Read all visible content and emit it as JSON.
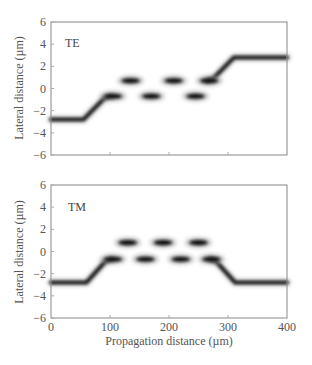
{
  "chart_data": [
    {
      "type": "heatmap",
      "title": "",
      "panel_label": "TE",
      "xlabel": "",
      "ylabel": "Lateral distance (µm)",
      "xlim": [
        0,
        400
      ],
      "ylim": [
        -6,
        6
      ],
      "xticks": [
        0,
        100,
        200,
        300,
        400
      ],
      "xtick_labels_shown": false,
      "yticks": [
        6,
        4,
        2,
        0,
        -2,
        -4,
        -6
      ],
      "ytick_labels": [
        "6",
        "4",
        "2",
        "0",
        "−2",
        "−4",
        "−6"
      ],
      "beam_path": [
        {
          "x": 0,
          "y": -2.8
        },
        {
          "x": 55,
          "y": -2.8
        },
        {
          "x": 90,
          "y": -0.9
        },
        {
          "x": 100,
          "y": -0.7
        }
      ],
      "beam_path_end": [
        {
          "x": 265,
          "y": 0.7
        },
        {
          "x": 275,
          "y": 0.9
        },
        {
          "x": 310,
          "y": 2.8
        },
        {
          "x": 400,
          "y": 2.8
        }
      ],
      "blobs": [
        {
          "x": 105,
          "y": -0.7
        },
        {
          "x": 135,
          "y": 0.7
        },
        {
          "x": 170,
          "y": -0.7
        },
        {
          "x": 208,
          "y": 0.7
        },
        {
          "x": 245,
          "y": -0.7
        },
        {
          "x": 268,
          "y": 0.7
        }
      ]
    },
    {
      "type": "heatmap",
      "title": "",
      "panel_label": "TM",
      "xlabel": "Propagation distance (µm)",
      "ylabel": "Lateral distance (µm)",
      "xlim": [
        0,
        400
      ],
      "ylim": [
        -6,
        6
      ],
      "xticks": [
        0,
        100,
        200,
        300,
        400
      ],
      "xtick_labels": [
        "0",
        "100",
        "200",
        "300",
        "400"
      ],
      "yticks": [
        6,
        4,
        2,
        0,
        -2,
        -4,
        -6
      ],
      "ytick_labels": [
        "6",
        "4",
        "2",
        "0",
        "−2",
        "−4",
        "−6"
      ],
      "beam_path": [
        {
          "x": 0,
          "y": -2.8
        },
        {
          "x": 60,
          "y": -2.8
        },
        {
          "x": 92,
          "y": -0.9
        },
        {
          "x": 102,
          "y": -0.7
        }
      ],
      "beam_path_end": [
        {
          "x": 270,
          "y": -0.7
        },
        {
          "x": 280,
          "y": -0.9
        },
        {
          "x": 312,
          "y": -2.8
        },
        {
          "x": 400,
          "y": -2.8
        }
      ],
      "blobs": [
        {
          "x": 105,
          "y": -0.7
        },
        {
          "x": 130,
          "y": 0.8
        },
        {
          "x": 160,
          "y": -0.7
        },
        {
          "x": 190,
          "y": 0.8
        },
        {
          "x": 220,
          "y": -0.7
        },
        {
          "x": 250,
          "y": 0.8
        },
        {
          "x": 272,
          "y": -0.7
        }
      ]
    }
  ],
  "panels": {
    "top": {
      "label": "TE",
      "ylabel": "Lateral distance (µm)"
    },
    "bottom": {
      "label": "TM",
      "ylabel": "Lateral distance (µm)",
      "xlabel": "Propagation distance (µm)"
    }
  },
  "colors": {
    "axis": "#888888",
    "beam": "#111111",
    "text": "#555555"
  }
}
